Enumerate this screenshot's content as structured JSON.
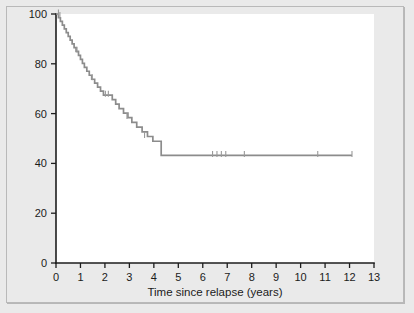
{
  "figure": {
    "background_color": "#eaeaea",
    "plot_background_color": "#ffffff",
    "border_color": "#b9b9b9"
  },
  "axis_titles": {
    "x": "Time since relapse (years)",
    "y": ""
  },
  "ticks": {
    "x_labels": [
      "0",
      "1",
      "2",
      "3",
      "4",
      "5",
      "6",
      "7",
      "8",
      "9",
      "10",
      "11",
      "12",
      "13"
    ],
    "y_labels": [
      "0",
      "20",
      "40",
      "60",
      "80",
      "100"
    ]
  },
  "chart_data": {
    "type": "line",
    "subtype": "kaplan-meier-step",
    "title": "",
    "xlabel": "Time since relapse (years)",
    "ylabel": "",
    "xlim": [
      0,
      13
    ],
    "ylim": [
      0,
      100
    ],
    "xticks": [
      0,
      1,
      2,
      3,
      4,
      5,
      6,
      7,
      8,
      9,
      10,
      11,
      12,
      13
    ],
    "yticks": [
      0,
      20,
      40,
      60,
      80,
      100
    ],
    "grid": false,
    "legend": false,
    "legend_position": "none",
    "line_color": "#8c8c8c",
    "censor_color": "#9a9a9a",
    "series": [
      {
        "name": "Survival",
        "step": "post",
        "x": [
          0.0,
          0.1,
          0.18,
          0.26,
          0.34,
          0.42,
          0.5,
          0.58,
          0.66,
          0.74,
          0.82,
          0.92,
          1.0,
          1.08,
          1.16,
          1.26,
          1.36,
          1.46,
          1.58,
          1.7,
          1.82,
          1.94,
          2.06,
          2.18,
          2.3,
          2.44,
          2.58,
          2.76,
          2.94,
          3.1,
          3.3,
          3.52,
          3.74,
          3.96,
          4.3,
          12.1
        ],
        "y": [
          100.0,
          98.5,
          97.0,
          95.5,
          94.0,
          92.5,
          91.0,
          89.5,
          88.0,
          86.5,
          85.0,
          83.4,
          81.8,
          80.2,
          78.6,
          77.0,
          75.4,
          73.8,
          72.2,
          70.6,
          69.0,
          67.4,
          67.4,
          67.4,
          65.6,
          63.8,
          62.0,
          60.2,
          58.4,
          56.5,
          54.6,
          52.7,
          50.8,
          48.9,
          43.2,
          43.2
        ]
      }
    ],
    "censored_points": [
      {
        "x": 0.1,
        "y": 100.0
      },
      {
        "x": 0.16,
        "y": 99.0
      },
      {
        "x": 0.86,
        "y": 85.0
      },
      {
        "x": 1.48,
        "y": 74.0
      },
      {
        "x": 2.02,
        "y": 67.4
      },
      {
        "x": 2.14,
        "y": 67.4
      },
      {
        "x": 2.9,
        "y": 58.4
      },
      {
        "x": 3.62,
        "y": 50.8
      },
      {
        "x": 6.4,
        "y": 43.2
      },
      {
        "x": 6.58,
        "y": 43.2
      },
      {
        "x": 6.76,
        "y": 43.2
      },
      {
        "x": 6.94,
        "y": 43.2
      },
      {
        "x": 7.7,
        "y": 43.2
      },
      {
        "x": 10.7,
        "y": 43.2
      },
      {
        "x": 12.1,
        "y": 43.2
      }
    ],
    "plateau_value": 43.2,
    "plateau_start_x": 4.3,
    "curve_end_x": 12.1
  }
}
